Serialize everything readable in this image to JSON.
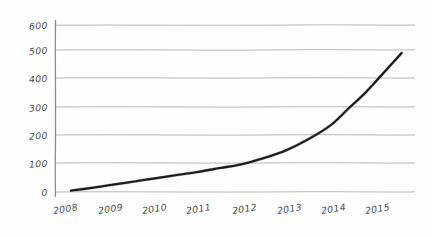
{
  "chart_data": {
    "type": "line",
    "style": "hand-drawn-sketch",
    "title": "",
    "subtitle": "",
    "xlabel": "",
    "ylabel": "",
    "grid": true,
    "legend": false,
    "legend_position": "none",
    "xlim": [
      2007.8,
      2015.9
    ],
    "ylim": [
      0,
      600
    ],
    "y_ticks": [
      0,
      100,
      200,
      300,
      400,
      500,
      600
    ],
    "y_tick_labels": [
      "0",
      "100",
      "200",
      "300",
      "400",
      "500",
      "600"
    ],
    "x_ticks": [
      2008,
      2009,
      2010,
      2011,
      2012,
      2013,
      2014,
      2015
    ],
    "x_tick_labels": [
      "2008",
      "2009",
      "2010",
      "2011",
      "2012",
      "2013",
      "2014",
      "2015"
    ],
    "series": [
      {
        "name": "growth",
        "color": "#1a1a1a",
        "x": [
          2008.15,
          2008.5,
          2009.0,
          2009.5,
          2010.0,
          2010.5,
          2011.0,
          2011.5,
          2012.0,
          2012.5,
          2013.0,
          2013.5,
          2014.0,
          2014.4,
          2014.8,
          2015.2,
          2015.6
        ],
        "values": [
          5,
          12,
          24,
          36,
          48,
          60,
          72,
          86,
          100,
          122,
          150,
          190,
          240,
          300,
          360,
          430,
          500
        ]
      }
    ],
    "annotations": []
  },
  "axes": {
    "y_axis_name": "value-axis",
    "x_axis_name": "year-axis"
  },
  "colors": {
    "background": "#fefefe",
    "gridline": "#b0b0b0",
    "axis": "#8e8e8e",
    "line": "#1a1a1a",
    "tick_text": "#4a4a4a"
  }
}
